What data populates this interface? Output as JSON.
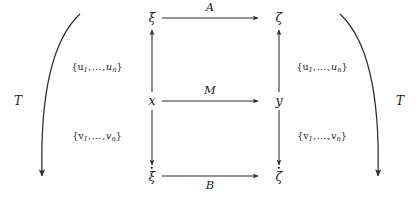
{
  "diagram": {
    "type": "commutative-diagram",
    "nodes": {
      "top_left": "ξ",
      "top_right": "ζ",
      "mid_left": "x",
      "mid_right": "y",
      "bottom_left": "ξ",
      "bottom_right": "ζ"
    },
    "horizontal_arrows": [
      {
        "id": "top",
        "label": "A",
        "from": "ξ",
        "to": "ζ",
        "direction": "right"
      },
      {
        "id": "middle",
        "label": "M",
        "from": "x",
        "to": "y",
        "direction": "right"
      },
      {
        "id": "bottom",
        "label": "B",
        "from": "ξ̇",
        "to": "ζ̇",
        "direction": "right"
      }
    ],
    "vertical_arrows": [
      {
        "id": "left-up",
        "label_prefix": "{u",
        "label_sub1": "1",
        "label_mid": ",…,",
        "label_var": "u",
        "label_sub2": "n",
        "label_suffix": "}",
        "direction": "up"
      },
      {
        "id": "right-up",
        "direction": "up"
      },
      {
        "id": "left-down",
        "label_prefix": "{v",
        "label_sub1": "1",
        "label_mid": ",…,",
        "label_var": "v",
        "label_sub2": "n",
        "label_suffix": "}",
        "direction": "down"
      },
      {
        "id": "right-down",
        "direction": "down"
      }
    ],
    "set_labels": {
      "u_open": "{u",
      "u_one": "1",
      "u_ellipsis": ",…,",
      "u_var": "u",
      "u_n": "n",
      "u_close": "}",
      "v_open": "{v",
      "v_one": "1",
      "v_ellipsis": ",…,",
      "v_var": "v",
      "v_n": "n",
      "v_close": "}"
    },
    "outer_arrows": [
      {
        "id": "left-curve",
        "label": "T",
        "direction": "down"
      },
      {
        "id": "right-curve",
        "label": "T",
        "direction": "down"
      }
    ],
    "colors": {
      "stroke": "#2b2b2b",
      "text": "#1a1a1a",
      "background": "#ffffff"
    }
  }
}
